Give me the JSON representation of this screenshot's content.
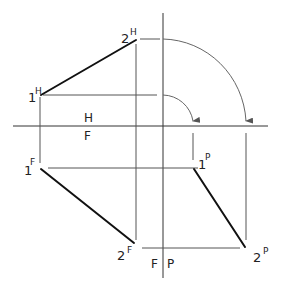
{
  "diagram": {
    "type": "orthographic projection of a line segment (descriptive geometry)",
    "fold_lines": {
      "horizontal": {
        "above": "H",
        "below": "F"
      },
      "vertical": {
        "left": "F",
        "right": "P"
      }
    },
    "points": [
      {
        "id": "1H",
        "num": "1",
        "view": "H"
      },
      {
        "id": "2H",
        "num": "2",
        "view": "H"
      },
      {
        "id": "1F",
        "num": "1",
        "view": "F"
      },
      {
        "id": "2F",
        "num": "2",
        "view": "F"
      },
      {
        "id": "1P",
        "num": "1",
        "view": "P"
      },
      {
        "id": "2P",
        "num": "2",
        "view": "P"
      }
    ],
    "line_color": "#111111",
    "projector_color": "#555555"
  }
}
